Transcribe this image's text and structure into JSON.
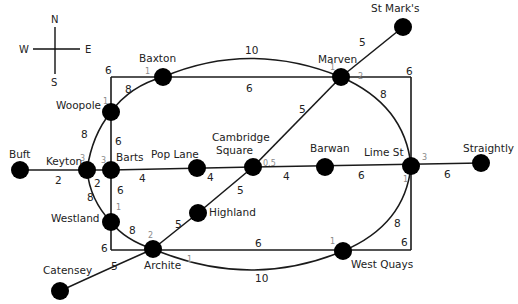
{
  "compass": {
    "north": "N",
    "south": "S",
    "east": "E",
    "west": "W"
  },
  "stations": [
    {
      "id": "st_marks",
      "name": "St Mark's",
      "x": 403,
      "y": 27
    },
    {
      "id": "marven",
      "name": "Marven",
      "x": 341,
      "y": 77
    },
    {
      "id": "baxton",
      "name": "Baxton",
      "x": 163,
      "y": 77
    },
    {
      "id": "woopole",
      "name": "Woopole",
      "x": 111,
      "y": 112
    },
    {
      "id": "keyton",
      "name": "Keyton",
      "x": 87,
      "y": 170
    },
    {
      "id": "barts",
      "name": "Barts",
      "x": 111,
      "y": 170
    },
    {
      "id": "buft",
      "name": "Buft",
      "x": 20,
      "y": 170
    },
    {
      "id": "pop_lane",
      "name": "Pop Lane",
      "x": 197,
      "y": 168
    },
    {
      "id": "cambridge_square",
      "name": "Cambridge Square",
      "x": 253,
      "y": 167
    },
    {
      "id": "barwan",
      "name": "Barwan",
      "x": 325,
      "y": 167
    },
    {
      "id": "lime_st",
      "name": "Lime St",
      "x": 411,
      "y": 166
    },
    {
      "id": "straightly",
      "name": "Straightly",
      "x": 481,
      "y": 163
    },
    {
      "id": "highland",
      "name": "Highland",
      "x": 198,
      "y": 213
    },
    {
      "id": "westland",
      "name": "Westland",
      "x": 111,
      "y": 222
    },
    {
      "id": "archite",
      "name": "Archite",
      "x": 153,
      "y": 249
    },
    {
      "id": "west_quays",
      "name": "West Quays",
      "x": 343,
      "y": 251
    },
    {
      "id": "catensey",
      "name": "Catensey",
      "x": 60,
      "y": 291
    }
  ],
  "edge_weights": {
    "baxton_marven_arc": "10",
    "baxton_marven_straight": "6",
    "woopole_baxton_arc": "8",
    "corner_top_left": "6",
    "corner_top_right": "6",
    "marven_st_marks": "5",
    "marven_lime_st_arc": "8",
    "marven_cambridge": "5",
    "woopole_barts": "6",
    "woopole_keyton_arc": "8",
    "buft_keyton": "2",
    "keyton_barts": "2",
    "barts_pop_lane": "4",
    "pop_lane_cambridge": "4",
    "cambridge_barwan": "4",
    "barwan_lime_st": "6",
    "lime_st_straightly": "6",
    "cambridge_highland": "5",
    "highland_archite": "5",
    "barts_westland": "6",
    "keyton_westland_arc": "8",
    "westland_archite_arc": "8",
    "corner_bottom_left": "6",
    "archite_west_quays_straight": "6",
    "archite_west_quays_arc": "10",
    "west_quays_lime_st_arc": "8",
    "corner_bottom_right": "6",
    "archite_catensey": "5"
  },
  "penalties": {
    "baxton": "1",
    "marven_west": "1",
    "marven_east": "2",
    "woopole": "1",
    "keyton": "3",
    "barts": "3",
    "cambridge_square": "0.5",
    "lime_st_top": "3",
    "lime_st_bottom": "1",
    "westland": "1",
    "archite_top": "2",
    "archite_bottom": "1",
    "west_quays": "1"
  },
  "colors": {
    "node": "#000000",
    "edge": "#1a1a1a",
    "text": "#222222",
    "penalty_text": "#8a8a8a",
    "background": "#ffffff"
  }
}
